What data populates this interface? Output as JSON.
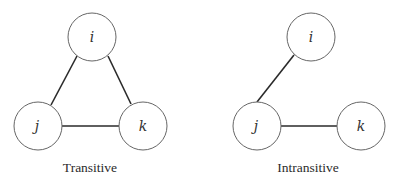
{
  "diagrams": [
    {
      "caption": "Transitive",
      "nodes": [
        {
          "id": "i",
          "label": "i",
          "cx": 92,
          "cy": 37
        },
        {
          "id": "j",
          "label": "j",
          "cx": 38,
          "cy": 126
        },
        {
          "id": "k",
          "label": "k",
          "cx": 143,
          "cy": 126
        }
      ],
      "edges": [
        [
          "i",
          "j"
        ],
        [
          "i",
          "k"
        ],
        [
          "j",
          "k"
        ]
      ]
    },
    {
      "caption": "Intransitive",
      "nodes": [
        {
          "id": "i",
          "label": "i",
          "cx": 311,
          "cy": 37
        },
        {
          "id": "j",
          "label": "j",
          "cx": 257,
          "cy": 126
        },
        {
          "id": "k",
          "label": "k",
          "cx": 361,
          "cy": 126
        }
      ],
      "edges": [
        [
          "i",
          "j"
        ],
        [
          "j",
          "k"
        ]
      ]
    }
  ],
  "node_radius": 24
}
